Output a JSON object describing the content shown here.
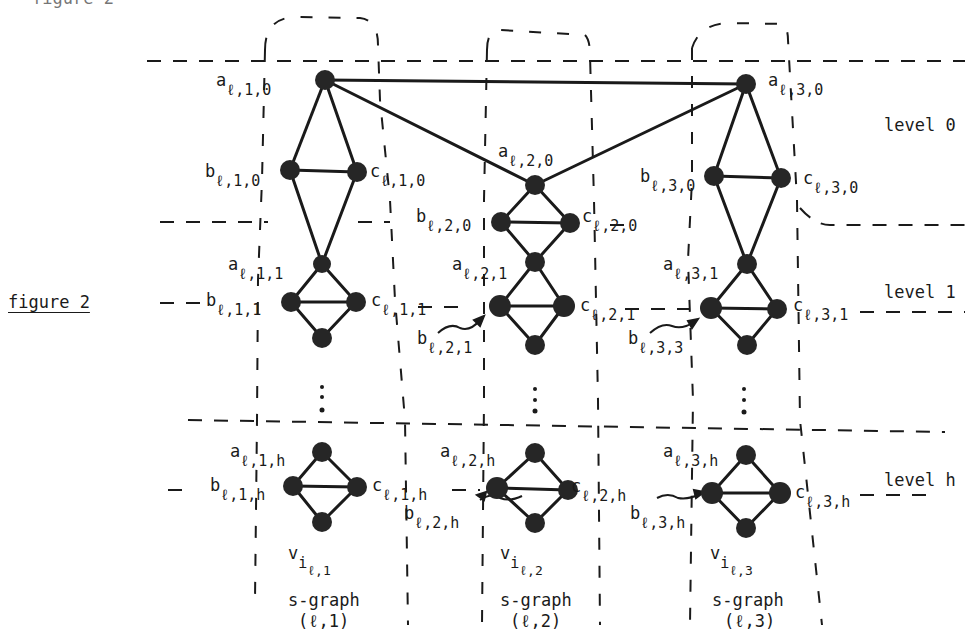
{
  "figure": {
    "caption": "figure 2",
    "top_cut_text": "figure 2"
  },
  "levels": [
    {
      "id": "level-0",
      "label": "level 0"
    },
    {
      "id": "level-1",
      "label": "level 1"
    },
    {
      "id": "level-h",
      "label": "level h"
    }
  ],
  "sgraphs": [
    {
      "id": "s1",
      "vertex_label": "v",
      "vertex_sub": "i",
      "vertex_subsub": "ℓ,1",
      "name": "s-graph",
      "index": "(ℓ,1)"
    },
    {
      "id": "s2",
      "vertex_label": "v",
      "vertex_sub": "i",
      "vertex_subsub": "ℓ,2",
      "name": "s-graph",
      "index": "(ℓ,2)"
    },
    {
      "id": "s3",
      "vertex_label": "v",
      "vertex_sub": "i",
      "vertex_subsub": "ℓ,3",
      "name": "s-graph",
      "index": "(ℓ,3)"
    }
  ],
  "node_labels": {
    "a_l10": {
      "base": "a",
      "sub": "ℓ,1,0"
    },
    "b_l10": {
      "base": "b",
      "sub": "ℓ,1,0"
    },
    "c_l10": {
      "base": "c",
      "sub": "ℓ,1,0"
    },
    "a_l20": {
      "base": "a",
      "sub": "ℓ,2,0"
    },
    "b_l20": {
      "base": "b",
      "sub": "ℓ,2,0"
    },
    "c_l20": {
      "base": "c",
      "sub": "ℓ,2,0"
    },
    "a_l30": {
      "base": "a",
      "sub": "ℓ,3,0"
    },
    "b_l30": {
      "base": "b",
      "sub": "ℓ,3,0"
    },
    "c_l30": {
      "base": "c",
      "sub": "ℓ,3,0"
    },
    "a_l11": {
      "base": "a",
      "sub": "ℓ,1,1"
    },
    "b_l11": {
      "base": "b",
      "sub": "ℓ,1,1"
    },
    "c_l11": {
      "base": "c",
      "sub": "ℓ,1,1"
    },
    "a_l21": {
      "base": "a",
      "sub": "ℓ,2,1"
    },
    "b_l21": {
      "base": "b",
      "sub": "ℓ,2,1"
    },
    "c_l21": {
      "base": "c",
      "sub": "ℓ,2,1"
    },
    "a_l31": {
      "base": "a",
      "sub": "ℓ,3,1"
    },
    "b_l33": {
      "base": "b",
      "sub": "ℓ,3,3"
    },
    "c_l31": {
      "base": "c",
      "sub": "ℓ,3,1"
    },
    "a_l1h": {
      "base": "a",
      "sub": "ℓ,1,h"
    },
    "b_l1h": {
      "base": "b",
      "sub": "ℓ,1,h"
    },
    "c_l1h": {
      "base": "c",
      "sub": "ℓ,1,h"
    },
    "a_l2h": {
      "base": "a",
      "sub": "ℓ,2,h"
    },
    "b_l2h": {
      "base": "b",
      "sub": "ℓ,2,h"
    },
    "c_l2h": {
      "base": "c",
      "sub": "ℓ,2,h"
    },
    "a_l3h": {
      "base": "a",
      "sub": "ℓ,3,h"
    },
    "b_l3h": {
      "base": "b",
      "sub": "ℓ,3,h"
    },
    "c_l3h": {
      "base": "c",
      "sub": "ℓ,3,h"
    }
  },
  "ellipsis": "⋮",
  "colors": {
    "ink": "#1a1a1a",
    "node": "#262626",
    "background": "#ffffff"
  }
}
